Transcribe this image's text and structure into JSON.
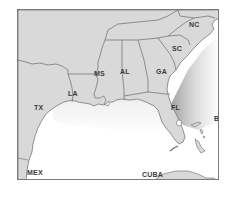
{
  "map": {
    "title": "",
    "region": "Southeastern United States and Gulf of Mexico",
    "colors": {
      "land": "#d9d9d9",
      "border": "#6a6a6a",
      "water": "#ffffff",
      "water_shade": "#9a9a9a",
      "frame": "#7a7a7a",
      "label": "#3a3a3a"
    },
    "labels": {
      "nc": "NC",
      "sc": "SC",
      "ga": "GA",
      "al": "AL",
      "ms": "MS",
      "la": "LA",
      "tx": "TX",
      "fl": "FL",
      "bah": "BAH",
      "mex": "MEX",
      "cuba": "CUBA"
    }
  }
}
